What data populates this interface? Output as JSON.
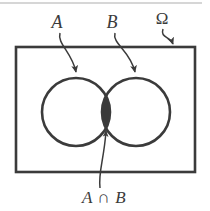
{
  "figure": {
    "type": "venn-diagram",
    "background_color": "#ffffff",
    "stroke_color": "#3b3b3b",
    "fill_color": "#3a3a3a",
    "top_rule_color": "#c9c9c9"
  },
  "labels": {
    "set_a": "A",
    "set_b": "B",
    "universe": "Ω",
    "intersection": "A ∩ B"
  },
  "shapes": {
    "universe_rect": {
      "name": "Ω",
      "x": 16,
      "y": 47,
      "width": 179,
      "height": 125,
      "stroke_width": 2.6
    },
    "circle_a": {
      "name": "A",
      "cx": 76,
      "cy": 112,
      "r": 34,
      "stroke_width": 2.6
    },
    "circle_b": {
      "name": "B",
      "cx": 136,
      "cy": 112,
      "r": 34,
      "stroke_width": 2.6
    },
    "intersection_lens": {
      "name": "A ∩ B",
      "filled": true,
      "fill": "#3a3a3a"
    }
  },
  "annotations": [
    {
      "name": "label-a",
      "text": "A",
      "x": 57,
      "y": 28
    },
    {
      "name": "label-b",
      "text": "B",
      "x": 112,
      "y": 28
    },
    {
      "name": "label-omega",
      "text": "Ω",
      "x": 162,
      "y": 24
    },
    {
      "name": "label-intersection",
      "text": "A ∩ B",
      "x": 104,
      "y": 203
    }
  ]
}
